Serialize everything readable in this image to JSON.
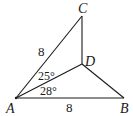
{
  "figure": {
    "points": {
      "A": {
        "label": "A",
        "x": 16,
        "y": 98
      },
      "B": {
        "label": "B",
        "x": 124,
        "y": 98
      },
      "C": {
        "label": "C",
        "x": 82,
        "y": 16
      },
      "D": {
        "label": "D",
        "x": 82,
        "y": 64
      }
    },
    "segments": [
      "AC",
      "AB",
      "AD",
      "CD",
      "DB"
    ],
    "side_labels": {
      "AC": "8",
      "AB": "8"
    },
    "angle_labels": {
      "CAD": "25°",
      "DAB": "28°"
    },
    "line_color": "#1a1a1a"
  }
}
